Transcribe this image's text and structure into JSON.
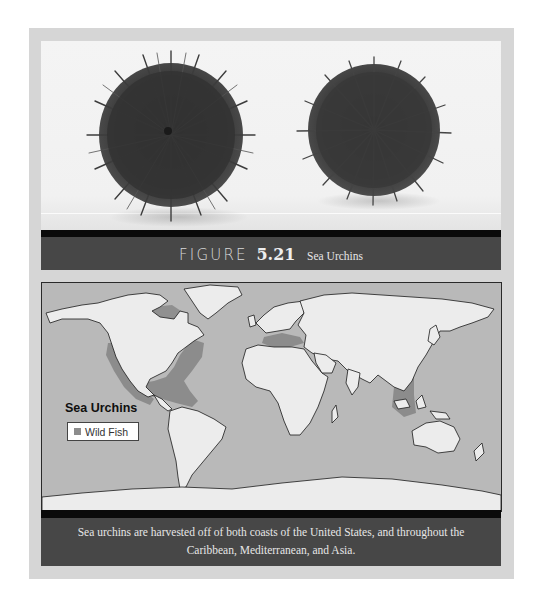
{
  "figure": {
    "label_word": "FIGURE",
    "number": "5.21",
    "name": "Sea Urchins",
    "photo": {
      "subject": "two sea urchins on white background",
      "items": [
        {
          "name": "urchin-left",
          "cx": 171,
          "cy": 132,
          "r": 80
        },
        {
          "name": "urchin-right",
          "cx": 374,
          "cy": 124,
          "r": 74
        }
      ]
    },
    "map": {
      "legend_title": "Sea Urchins",
      "legend_items": [
        {
          "label": "Wild Fish",
          "color": "#8c8c8c"
        }
      ],
      "colors": {
        "ocean": "#b9b9b9",
        "land": "#ececec",
        "harvest_region": "#8c8c8c",
        "coastline": "#1a1a1a"
      }
    },
    "caption": "Sea urchins are harvested off of both coasts of the United States, and throughout the Caribbean, Mediterranean, and Asia."
  },
  "colors": {
    "frame": "#d6d6d6",
    "band": "#474747",
    "band_stripe": "#0a0a0a",
    "band_text": "#e8e8e8"
  }
}
